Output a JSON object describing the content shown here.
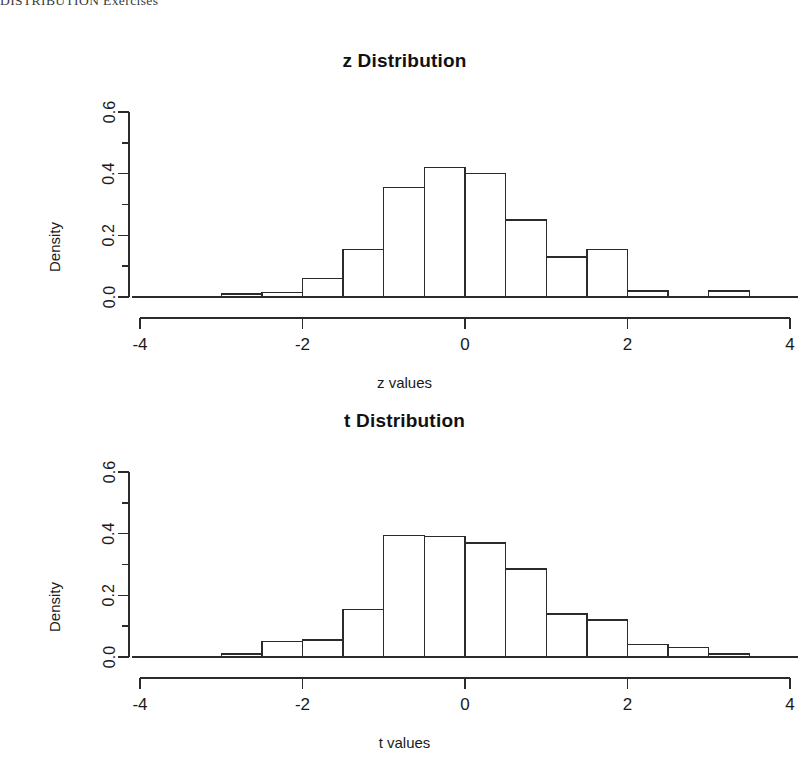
{
  "page": {
    "running_header": "DISTRIBUTION Exercises",
    "background_color": "#ffffff",
    "ink_color": "#1a1a1a"
  },
  "figures": [
    {
      "id": "z-distribution",
      "title": "z Distribution",
      "xlabel": "z values",
      "ylabel": "Density"
    },
    {
      "id": "t-distribution",
      "title": "t Distribution",
      "xlabel": "t values",
      "ylabel": "Density"
    }
  ],
  "chart_data": [
    {
      "type": "bar",
      "subtype": "histogram",
      "title": "z Distribution",
      "xlabel": "z values",
      "ylabel": "Density",
      "xlim": [
        -4,
        4
      ],
      "ylim": [
        0.0,
        0.6
      ],
      "xticks": [
        -4,
        -2,
        0,
        2,
        4
      ],
      "xticklabels": [
        "-4",
        "-2",
        "0",
        "2",
        "4"
      ],
      "xminorticks": [
        -3,
        -1,
        1,
        3
      ],
      "yticks": [
        0.0,
        0.2,
        0.4,
        0.6
      ],
      "yticklabels": [
        "0.0",
        "0.2",
        "0.4",
        "0.6"
      ],
      "yminorticks": [
        0.1,
        0.3,
        0.5
      ],
      "grid": false,
      "legend": null,
      "binwidth": 0.5,
      "bin_edges": [
        -3.0,
        -2.5,
        -2.0,
        -1.5,
        -1.0,
        -0.5,
        0.0,
        0.5,
        1.0,
        1.5,
        2.0,
        2.5,
        3.0,
        3.5
      ],
      "bar_fill": "#ffffff",
      "bar_stroke": "#2b2b2b",
      "bins": [
        {
          "x0": -3.0,
          "x1": -2.5,
          "density": 0.01
        },
        {
          "x0": -2.5,
          "x1": -2.0,
          "density": 0.015
        },
        {
          "x0": -2.0,
          "x1": -1.5,
          "density": 0.06
        },
        {
          "x0": -1.5,
          "x1": -1.0,
          "density": 0.155
        },
        {
          "x0": -1.0,
          "x1": -0.5,
          "density": 0.355
        },
        {
          "x0": -0.5,
          "x1": 0.0,
          "density": 0.42
        },
        {
          "x0": 0.0,
          "x1": 0.5,
          "density": 0.4
        },
        {
          "x0": 0.5,
          "x1": 1.0,
          "density": 0.25
        },
        {
          "x0": 1.0,
          "x1": 1.5,
          "density": 0.13
        },
        {
          "x0": 1.5,
          "x1": 2.0,
          "density": 0.155
        },
        {
          "x0": 2.0,
          "x1": 2.5,
          "density": 0.02
        },
        {
          "x0": 2.5,
          "x1": 3.0,
          "density": 0.0
        },
        {
          "x0": 3.0,
          "x1": 3.5,
          "density": 0.02
        }
      ]
    },
    {
      "type": "bar",
      "subtype": "histogram",
      "title": "t Distribution",
      "xlabel": "t values",
      "ylabel": "Density",
      "xlim": [
        -4,
        4
      ],
      "ylim": [
        0.0,
        0.6
      ],
      "xticks": [
        -4,
        -2,
        0,
        2,
        4
      ],
      "xticklabels": [
        "-4",
        "-2",
        "0",
        "2",
        "4"
      ],
      "xminorticks": [
        -3,
        -1,
        1,
        3
      ],
      "yticks": [
        0.0,
        0.2,
        0.4,
        0.6
      ],
      "yticklabels": [
        "0.0",
        "0.2",
        "0.4",
        "0.6"
      ],
      "yminorticks": [
        0.1,
        0.3,
        0.5
      ],
      "grid": false,
      "legend": null,
      "binwidth": 0.5,
      "bin_edges": [
        -3.0,
        -2.5,
        -2.0,
        -1.5,
        -1.0,
        -0.5,
        0.0,
        0.5,
        1.0,
        1.5,
        2.0,
        2.5,
        3.0,
        3.5
      ],
      "bar_fill": "#ffffff",
      "bar_stroke": "#2b2b2b",
      "bins": [
        {
          "x0": -3.0,
          "x1": -2.5,
          "density": 0.01
        },
        {
          "x0": -2.5,
          "x1": -2.0,
          "density": 0.05
        },
        {
          "x0": -2.0,
          "x1": -1.5,
          "density": 0.055
        },
        {
          "x0": -1.5,
          "x1": -1.0,
          "density": 0.155
        },
        {
          "x0": -1.0,
          "x1": -0.5,
          "density": 0.395
        },
        {
          "x0": -0.5,
          "x1": 0.0,
          "density": 0.39
        },
        {
          "x0": 0.0,
          "x1": 0.5,
          "density": 0.37
        },
        {
          "x0": 0.5,
          "x1": 1.0,
          "density": 0.285
        },
        {
          "x0": 1.0,
          "x1": 1.5,
          "density": 0.14
        },
        {
          "x0": 1.5,
          "x1": 2.0,
          "density": 0.12
        },
        {
          "x0": 2.0,
          "x1": 2.5,
          "density": 0.04
        },
        {
          "x0": 2.5,
          "x1": 3.0,
          "density": 0.03
        },
        {
          "x0": 3.0,
          "x1": 3.5,
          "density": 0.01
        }
      ]
    }
  ]
}
